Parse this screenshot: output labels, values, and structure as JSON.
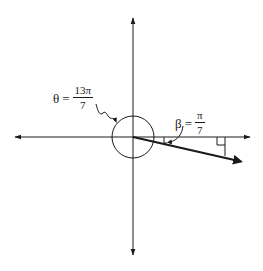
{
  "diagram": {
    "type": "angle-in-standard-position",
    "colors": {
      "ink": "#1a1a1a",
      "background": "#ffffff"
    },
    "axes": {
      "origin": [
        133,
        137
      ],
      "x_axis": {
        "from": [
          15,
          137
        ],
        "to": [
          250,
          137
        ],
        "arrows": "both"
      },
      "y_axis": {
        "from": [
          133,
          18
        ],
        "to": [
          133,
          255
        ],
        "arrows": "both"
      }
    },
    "circle": {
      "center": [
        133,
        137
      ],
      "radius": 21
    },
    "terminal_ray": {
      "from": [
        133,
        137
      ],
      "to": [
        244,
        162
      ]
    },
    "reference_triangle": {
      "drop_line": {
        "x": 225,
        "from_y": 137,
        "to_y": 156
      },
      "right_angle_mark": {
        "x": 217,
        "y": 137,
        "size": 8
      }
    },
    "labels": {
      "theta": {
        "symbol": "θ",
        "equals": "=",
        "numerator": "13π",
        "denominator": "7"
      },
      "beta": {
        "symbol": "β",
        "equals": "=",
        "numerator": "π",
        "denominator": "7"
      }
    }
  }
}
